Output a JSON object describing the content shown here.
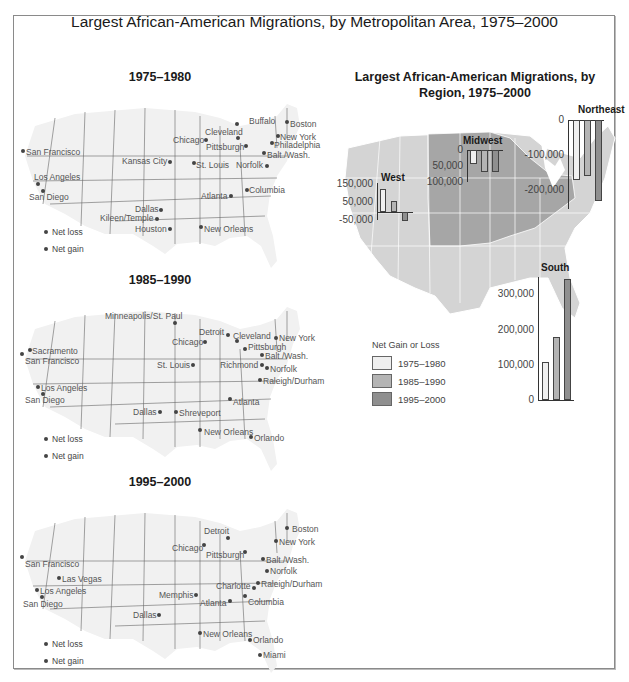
{
  "title": "Largest African-American Migrations, by Metropolitan Area, 1975–2000",
  "maps": [
    {
      "period": "1975–1980",
      "legend": {
        "loss": "Net loss",
        "gain": "Net gain"
      },
      "cities": [
        {
          "name": "Buffalo",
          "x": 237,
          "y": 124,
          "dx": 249,
          "dy": 117
        },
        {
          "name": "Boston",
          "x": 287,
          "y": 122,
          "dx": 290,
          "dy": 120
        },
        {
          "name": "Cleveland",
          "x": 238,
          "y": 138,
          "dx": 205,
          "dy": 128
        },
        {
          "name": "Chicago",
          "x": 206,
          "y": 140,
          "dx": 173,
          "dy": 136
        },
        {
          "name": "New York",
          "x": 278,
          "y": 136,
          "dx": 280,
          "dy": 133
        },
        {
          "name": "Philadelphia",
          "x": 272,
          "y": 143,
          "dx": 274,
          "dy": 141
        },
        {
          "name": "Pittsburgh",
          "x": 246,
          "y": 146,
          "dx": 206,
          "dy": 143
        },
        {
          "name": "Balt./Wash.",
          "x": 264,
          "y": 153,
          "dx": 267,
          "dy": 151
        },
        {
          "name": "San Francisco",
          "x": 23,
          "y": 151,
          "dx": 26,
          "dy": 148
        },
        {
          "name": "Kansas City",
          "x": 170,
          "y": 162,
          "dx": 122,
          "dy": 157
        },
        {
          "name": "St. Louis",
          "x": 194,
          "y": 163,
          "dx": 196,
          "dy": 161
        },
        {
          "name": "Norfolk",
          "x": 267,
          "y": 166,
          "dx": 236,
          "dy": 161
        },
        {
          "name": "Los Angeles",
          "x": 38,
          "y": 184,
          "dx": 34,
          "dy": 173
        },
        {
          "name": "San Diego",
          "x": 43,
          "y": 191,
          "dx": 29,
          "dy": 193
        },
        {
          "name": "Columbia",
          "x": 247,
          "y": 190,
          "dx": 249,
          "dy": 186
        },
        {
          "name": "Atlanta",
          "x": 231,
          "y": 196,
          "dx": 201,
          "dy": 192
        },
        {
          "name": "Dallas",
          "x": 161,
          "y": 210,
          "dx": 135,
          "dy": 205
        },
        {
          "name": "Kileen/Temple",
          "x": 157,
          "y": 219,
          "dx": 100,
          "dy": 214
        },
        {
          "name": "Houston",
          "x": 170,
          "y": 229,
          "dx": 135,
          "dy": 225
        },
        {
          "name": "New Orleans",
          "x": 201,
          "y": 227,
          "dx": 204,
          "dy": 225
        }
      ]
    },
    {
      "period": "1985–1990",
      "legend": {
        "loss": "Net loss",
        "gain": "Net gain"
      },
      "cities": [
        {
          "name": "Minneapolis/St. Paul",
          "x": 175,
          "y": 323,
          "dx": 105,
          "dy": 312
        },
        {
          "name": "Detroit",
          "x": 228,
          "y": 335,
          "dx": 199,
          "dy": 328
        },
        {
          "name": "Cleveland",
          "x": 237,
          "y": 341,
          "dx": 233,
          "dy": 332
        },
        {
          "name": "New York",
          "x": 276,
          "y": 338,
          "dx": 279,
          "dy": 334
        },
        {
          "name": "Chicago",
          "x": 205,
          "y": 342,
          "dx": 172,
          "dy": 338
        },
        {
          "name": "Pittsburgh",
          "x": 245,
          "y": 349,
          "dx": 248,
          "dy": 343
        },
        {
          "name": "Sacramento",
          "x": 30,
          "y": 350,
          "dx": 32,
          "dy": 347
        },
        {
          "name": "San Francisco",
          "x": 22,
          "y": 354,
          "dx": 25,
          "dy": 357
        },
        {
          "name": "Balt./Wash.",
          "x": 262,
          "y": 355,
          "dx": 265,
          "dy": 352
        },
        {
          "name": "St. Louis",
          "x": 193,
          "y": 365,
          "dx": 157,
          "dy": 361
        },
        {
          "name": "Richmond",
          "x": 262,
          "y": 365,
          "dx": 220,
          "dy": 361
        },
        {
          "name": "Norfolk",
          "x": 267,
          "y": 368,
          "dx": 270,
          "dy": 365
        },
        {
          "name": "Raleigh/Durham",
          "x": 260,
          "y": 380,
          "dx": 263,
          "dy": 377
        },
        {
          "name": "Los Angeles",
          "x": 38,
          "y": 387,
          "dx": 41,
          "dy": 384
        },
        {
          "name": "San Diego",
          "x": 43,
          "y": 394,
          "dx": 25,
          "dy": 396
        },
        {
          "name": "Atlanta",
          "x": 230,
          "y": 399,
          "dx": 233,
          "dy": 398
        },
        {
          "name": "Dallas",
          "x": 160,
          "y": 412,
          "dx": 133,
          "dy": 408
        },
        {
          "name": "Shreveport",
          "x": 176,
          "y": 412,
          "dx": 179,
          "dy": 409
        },
        {
          "name": "New Orleans",
          "x": 200,
          "y": 430,
          "dx": 204,
          "dy": 428
        },
        {
          "name": "Orlando",
          "x": 251,
          "y": 437,
          "dx": 254,
          "dy": 434
        }
      ]
    },
    {
      "period": "1995–2000",
      "legend": {
        "loss": "Net loss",
        "gain": "Net gain"
      },
      "cities": [
        {
          "name": "Detroit",
          "x": 228,
          "y": 538,
          "dx": 204,
          "dy": 527
        },
        {
          "name": "Boston",
          "x": 287,
          "y": 528,
          "dx": 292,
          "dy": 525
        },
        {
          "name": "New York",
          "x": 276,
          "y": 541,
          "dx": 279,
          "dy": 538
        },
        {
          "name": "Chicago",
          "x": 204,
          "y": 545,
          "dx": 172,
          "dy": 544
        },
        {
          "name": "Pittsburgh",
          "x": 245,
          "y": 552,
          "dx": 206,
          "dy": 551
        },
        {
          "name": "Balt./Wash.",
          "x": 263,
          "y": 559,
          "dx": 266,
          "dy": 556
        },
        {
          "name": "San Francisco",
          "x": 22,
          "y": 557,
          "dx": 25,
          "dy": 560
        },
        {
          "name": "Norfolk",
          "x": 267,
          "y": 571,
          "dx": 270,
          "dy": 567
        },
        {
          "name": "Las Vegas",
          "x": 59,
          "y": 578,
          "dx": 62,
          "dy": 575
        },
        {
          "name": "Charlotte",
          "x": 254,
          "y": 588,
          "dx": 216,
          "dy": 582
        },
        {
          "name": "Raleigh/Durham",
          "x": 258,
          "y": 583,
          "dx": 261,
          "dy": 580
        },
        {
          "name": "Los Angeles",
          "x": 37,
          "y": 590,
          "dx": 40,
          "dy": 587
        },
        {
          "name": "Memphis",
          "x": 196,
          "y": 595,
          "dx": 159,
          "dy": 591
        },
        {
          "name": "San Diego",
          "x": 42,
          "y": 597,
          "dx": 23,
          "dy": 600
        },
        {
          "name": "Columbia",
          "x": 245,
          "y": 596,
          "dx": 248,
          "dy": 598
        },
        {
          "name": "Atlanta",
          "x": 230,
          "y": 601,
          "dx": 200,
          "dy": 599
        },
        {
          "name": "Dallas",
          "x": 159,
          "y": 615,
          "dx": 133,
          "dy": 611
        },
        {
          "name": "New Orleans",
          "x": 200,
          "y": 633,
          "dx": 203,
          "dy": 630
        },
        {
          "name": "Orlando",
          "x": 250,
          "y": 640,
          "dx": 253,
          "dy": 636
        },
        {
          "name": "Miami",
          "x": 260,
          "y": 655,
          "dx": 263,
          "dy": 651
        }
      ]
    }
  ],
  "regional": {
    "title_line1": "Largest African-American Migrations, by",
    "title_line2": "Region, 1975–2000",
    "legend_title": "Net Gain or Loss",
    "legend_items": [
      "1975–1980",
      "1985–1990",
      "1995–2000"
    ],
    "colors": {
      "p1": "#efefef",
      "p2": "#b4b4b4",
      "p3": "#8f8f8f",
      "highlight_region": "#a6a6a6",
      "map_fill": "#d4d4d4"
    },
    "regions": {
      "west": {
        "label": "West",
        "ticks": [
          "150,000",
          "50,000",
          "-50,000"
        ]
      },
      "midwest": {
        "label": "Midwest",
        "ticks": [
          "0",
          "50,000",
          "100,000"
        ]
      },
      "northeast": {
        "label": "Northeast",
        "ticks": [
          "0",
          "-100,000",
          "-200,000"
        ]
      },
      "south": {
        "label": "South",
        "ticks": [
          "300,000",
          "200,000",
          "100,000",
          "0"
        ]
      }
    }
  },
  "chart_data": {
    "type": "bar",
    "title": "Largest African-American Migrations, by Region, 1975–2000",
    "categories": [
      "West",
      "Midwest",
      "Northeast",
      "South"
    ],
    "series": [
      {
        "name": "1975–1980",
        "values": [
          120000,
          -45000,
          -170000,
          110000
        ]
      },
      {
        "name": "1985–1990",
        "values": [
          55000,
          -70000,
          -160000,
          180000
        ]
      },
      {
        "name": "1995–2000",
        "values": [
          -45000,
          -70000,
          -230000,
          345000
        ]
      }
    ],
    "ylabel": "Net Gain or Loss",
    "legend_position": "left-center",
    "grid": false
  }
}
